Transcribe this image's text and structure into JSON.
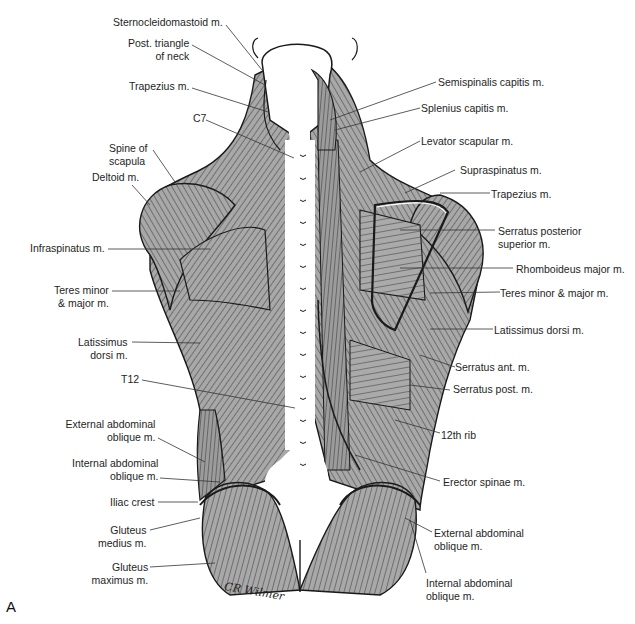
{
  "figure": {
    "panel_letter": "A",
    "signature": "CR Wilmer",
    "colors": {
      "muscle_fill": "#a6a6a6",
      "muscle_light": "#cfcfcf",
      "outline": "#1a1a1a",
      "bone_fill": "#ffffff",
      "leader_line": "#333333"
    },
    "labels_left": [
      {
        "id": "sternocleidomastoid",
        "lines": [
          "Sternocleidomastoid m."
        ]
      },
      {
        "id": "post-triangle-of-neck",
        "lines": [
          "Post. triangle",
          "of neck"
        ]
      },
      {
        "id": "trapezius-left",
        "lines": [
          "Trapezius m."
        ]
      },
      {
        "id": "c7",
        "lines": [
          "C7"
        ]
      },
      {
        "id": "spine-of-scapula",
        "lines": [
          "Spine of",
          "scapula"
        ]
      },
      {
        "id": "deltoid",
        "lines": [
          "Deltoid m."
        ]
      },
      {
        "id": "infraspinatus",
        "lines": [
          "Infraspinatus m."
        ]
      },
      {
        "id": "teres-left",
        "lines": [
          "Teres minor",
          "& major m."
        ]
      },
      {
        "id": "latissimus-left",
        "lines": [
          "Latissimus",
          "dorsi m."
        ]
      },
      {
        "id": "t12",
        "lines": [
          "T12"
        ]
      },
      {
        "id": "ext-oblique-left",
        "lines": [
          "External abdominal",
          "oblique m."
        ]
      },
      {
        "id": "int-oblique-left",
        "lines": [
          "Internal abdominal",
          "oblique m."
        ]
      },
      {
        "id": "iliac-crest",
        "lines": [
          "Iliac crest"
        ]
      },
      {
        "id": "gluteus-medius",
        "lines": [
          "Gluteus",
          "medius m."
        ]
      },
      {
        "id": "gluteus-maximus",
        "lines": [
          "Gluteus",
          "maximus m."
        ]
      }
    ],
    "labels_right": [
      {
        "id": "semispinalis-capitis",
        "lines": [
          "Semispinalis capitis m."
        ]
      },
      {
        "id": "splenius-capitis",
        "lines": [
          "Splenius capitis m."
        ]
      },
      {
        "id": "levator-scapulae",
        "lines": [
          "Levator scapular m."
        ]
      },
      {
        "id": "supraspinatus",
        "lines": [
          "Supraspinatus m."
        ]
      },
      {
        "id": "trapezius-right",
        "lines": [
          "Trapezius m."
        ]
      },
      {
        "id": "serratus-post-sup",
        "lines": [
          "Serratus posterior",
          "superior m."
        ]
      },
      {
        "id": "rhomboideus-major",
        "lines": [
          "Rhomboideus major m."
        ]
      },
      {
        "id": "teres-right",
        "lines": [
          "Teres minor & major m."
        ]
      },
      {
        "id": "latissimus-right",
        "lines": [
          "Latissimus dorsi m."
        ]
      },
      {
        "id": "serratus-ant",
        "lines": [
          "Serratus ant. m."
        ]
      },
      {
        "id": "serratus-post",
        "lines": [
          "Serratus post. m."
        ]
      },
      {
        "id": "12th-rib",
        "lines": [
          "12th rib"
        ]
      },
      {
        "id": "erector-spinae",
        "lines": [
          "Erector spinae m."
        ]
      },
      {
        "id": "ext-oblique-right",
        "lines": [
          "External abdominal",
          "oblique m."
        ]
      },
      {
        "id": "int-oblique-right",
        "lines": [
          "Internal abdominal",
          "oblique m."
        ]
      }
    ]
  }
}
